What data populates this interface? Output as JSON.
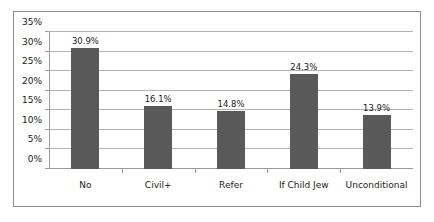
{
  "chart_data": {
    "type": "bar",
    "title": "",
    "subtitle": "",
    "xlabel": "",
    "ylabel": "",
    "categories": [
      "No",
      "Civil+",
      "Refer",
      "If Child Jew",
      "Unconditional"
    ],
    "values": [
      30.9,
      16.1,
      14.8,
      24.3,
      13.9
    ],
    "data_labels": [
      "30.9%",
      "16.1%",
      "14.8%",
      "24.3%",
      "13.9%"
    ],
    "ylim": [
      0,
      35
    ],
    "ytick_values": [
      0,
      5,
      10,
      15,
      20,
      25,
      30,
      35
    ],
    "ytick_labels": [
      "0%",
      "5%",
      "10%",
      "15%",
      "20%",
      "25%",
      "30%",
      "35%"
    ],
    "grid": "horizontal",
    "legend": "none",
    "series": [
      {
        "name": "",
        "values": [
          30.9,
          16.1,
          14.8,
          24.3,
          13.9
        ]
      }
    ],
    "colors": {
      "bar": "#595959",
      "gridline": "#b3b3b3",
      "axis": "#9a9a9a",
      "frame_border": "#8d8d8d",
      "plot_background": "#ffffff",
      "text": "#1a1a1a"
    }
  }
}
